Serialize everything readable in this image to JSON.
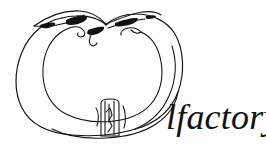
{
  "canvas": {
    "width": 266,
    "height": 155,
    "background_color": "#fdfdfd",
    "ink_color": "#111111"
  },
  "logo": {
    "wordmark_text": "lfactory",
    "wordmark_style": "italic serif",
    "wordmark_color": "#111111",
    "illustration_name": "apple-line-drawing",
    "illustration_description": "Hand-drawn pen-and-ink outline of an apple-like fruit with a leaf and stem at the top and a small calyx detail at the bottom center",
    "illustration_parts": [
      "outer-contour",
      "inner-contour",
      "leaf",
      "stem",
      "calyx-detail"
    ]
  }
}
